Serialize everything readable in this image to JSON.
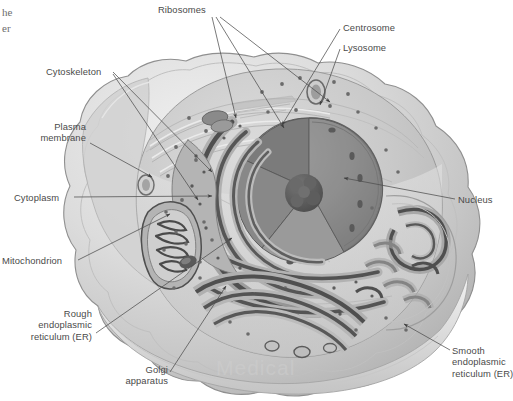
{
  "figure": {
    "kind": "animal-cell-cutaway-diagram",
    "title_fragment_line1": "he",
    "title_fragment_line2": "er",
    "watermark": "Medical"
  },
  "palette": {
    "background": "#ffffff",
    "label_text": "#4a4a4a",
    "leader_line": "#55545a",
    "membrane_outer": "#d8d8d8",
    "membrane_edge": "#9a9a9a",
    "cytoplasm": "#c9c9c9",
    "cytoplasm_light": "#dedede",
    "nucleus": "#8d8d8d",
    "nucleus_dark": "#6f6f6f",
    "nucleolus": "#595959",
    "er_body": "#a6a6a6",
    "er_dark": "#595959",
    "organelle_stroke": "#4f4f4f",
    "ribosome_dot": "#6b6b6b"
  },
  "labels": [
    {
      "id": "ribosomes",
      "name": "Ribosomes",
      "lines": [
        "Ribosomes"
      ],
      "x": 158,
      "y": 4,
      "align": "left"
    },
    {
      "id": "centrosome",
      "name": "Centrosome",
      "lines": [
        "Centrosome"
      ],
      "x": 343,
      "y": 22,
      "align": "left"
    },
    {
      "id": "lysosome",
      "name": "Lysosome",
      "lines": [
        "Lysosome"
      ],
      "x": 343,
      "y": 42,
      "align": "left"
    },
    {
      "id": "cytoskeleton",
      "name": "Cytoskeleton",
      "lines": [
        "Cytoskeleton"
      ],
      "x": 46,
      "y": 66,
      "align": "left"
    },
    {
      "id": "plasma-membrane",
      "name": "Plasma membrane",
      "lines": [
        "Plasma",
        "membrane"
      ],
      "x": 3,
      "y": 121,
      "align": "right",
      "w": 83
    },
    {
      "id": "cytoplasm",
      "name": "Cytoplasm",
      "lines": [
        "Cytoplasm"
      ],
      "x": 14,
      "y": 192,
      "align": "left"
    },
    {
      "id": "nucleus",
      "name": "Nucleus",
      "lines": [
        "Nucleus"
      ],
      "x": 458,
      "y": 194,
      "align": "left"
    },
    {
      "id": "mitochondrion",
      "name": "Mitochondrion",
      "lines": [
        "Mitochondrion"
      ],
      "x": 2,
      "y": 255,
      "align": "left"
    },
    {
      "id": "rough-er",
      "name": "Rough endoplasmic reticulum (ER)",
      "lines": [
        "Rough",
        "endoplasmic",
        "reticulum (ER)"
      ],
      "x": 2,
      "y": 308,
      "align": "right",
      "w": 90
    },
    {
      "id": "golgi",
      "name": "Golgi apparatus",
      "lines": [
        "Golgi",
        "apparatus"
      ],
      "x": 108,
      "y": 364,
      "align": "right",
      "w": 60
    },
    {
      "id": "smooth-er",
      "name": "Smooth endoplasmic reticulum (ER)",
      "lines": [
        "Smooth",
        "endoplasmic",
        "reticulum (ER)"
      ],
      "x": 452,
      "y": 345,
      "align": "left"
    }
  ]
}
